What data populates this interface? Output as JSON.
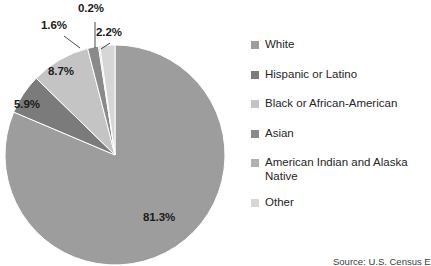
{
  "chart_data": {
    "type": "pie",
    "title": "",
    "xlabel": "",
    "ylabel": "",
    "legend_position": "right",
    "grid": false,
    "units": "percent",
    "categories": [
      "White",
      "Hispanic or Latino",
      "Black or African-American",
      "Asian",
      "American Indian and Alaska Native",
      "Other"
    ],
    "values": [
      81.3,
      5.9,
      8.7,
      1.6,
      0.2,
      2.2
    ],
    "data_labels": [
      "81.3%",
      "5.9%",
      "8.7%",
      "1.6%",
      "0.2%",
      "2.2%"
    ],
    "colors": [
      "#9d9d9d",
      "#7b7b7b",
      "#c4c4c4",
      "#8a8a8a",
      "#b0b0b0",
      "#d6d6d6"
    ],
    "slices": [
      {
        "label": "White",
        "value": 81.3,
        "data_label": "81.3%",
        "color": "#9d9d9d"
      },
      {
        "label": "Hispanic or Latino",
        "value": 5.9,
        "data_label": "5.9%",
        "color": "#7b7b7b"
      },
      {
        "label": "Black or African-American",
        "value": 8.7,
        "data_label": "8.7%",
        "color": "#c4c4c4"
      },
      {
        "label": "Asian",
        "value": 1.6,
        "data_label": "1.6%",
        "color": "#8a8a8a"
      },
      {
        "label": "American Indian and Alaska Native",
        "value": 0.2,
        "data_label": "0.2%",
        "color": "#b0b0b0"
      },
      {
        "label": "Other",
        "value": 2.2,
        "data_label": "2.2%",
        "color": "#d6d6d6"
      }
    ]
  },
  "legend": {
    "items": [
      {
        "label": "White",
        "color": "#9d9d9d"
      },
      {
        "label": "Hispanic or Latino",
        "color": "#7b7b7b"
      },
      {
        "label": "Black or African-American",
        "color": "#c4c4c4"
      },
      {
        "label": "Asian",
        "color": "#8a8a8a"
      },
      {
        "label": "American Indian and Alaska\nNative",
        "color": "#b0b0b0"
      },
      {
        "label": "Other",
        "color": "#d6d6d6"
      }
    ]
  },
  "source": {
    "text": "Source: U.S. Census E"
  }
}
